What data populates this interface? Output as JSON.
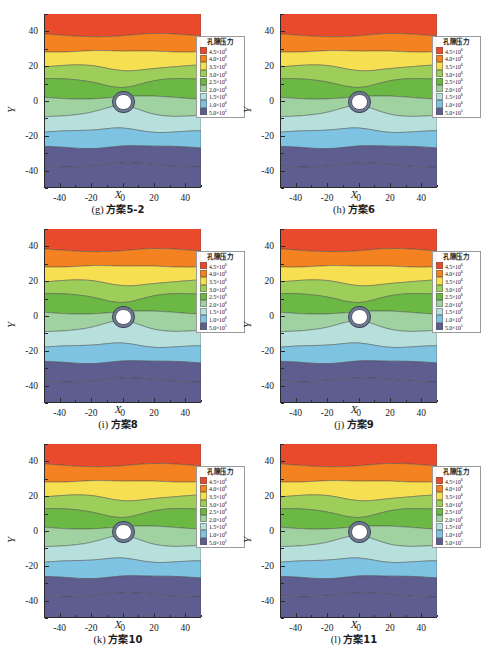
{
  "figure": {
    "axis_x_label": "X",
    "axis_y_label": "Y",
    "bottom_note": "",
    "legend_title": "孔隙压力"
  },
  "legend": {
    "title": "孔隙压力",
    "entries": [
      {
        "label": "4.5×10",
        "exp": "6",
        "color": "#ea4a2c"
      },
      {
        "label": "4.0×10",
        "exp": "6",
        "color": "#f58220"
      },
      {
        "label": "3.5×10",
        "exp": "6",
        "color": "#f7df52"
      },
      {
        "label": "3.0×10",
        "exp": "6",
        "color": "#9ece5a"
      },
      {
        "label": "2.5×10",
        "exp": "6",
        "color": "#6cb844"
      },
      {
        "label": "2.0×10",
        "exp": "6",
        "color": "#9fd2a0"
      },
      {
        "label": "1.5×10",
        "exp": "6",
        "color": "#b7dfdc"
      },
      {
        "label": "1.0×10",
        "exp": "6",
        "color": "#7fc3e2"
      },
      {
        "label": "5.0×10",
        "exp": "5",
        "color": "#5d5d90"
      }
    ]
  },
  "axes": {
    "x_ticks": [
      "-40",
      "-20",
      "0",
      "20",
      "40"
    ],
    "x_tick_values": [
      -40,
      -20,
      0,
      20,
      40
    ],
    "y_ticks": [
      "40",
      "20",
      "0",
      "-20",
      "-40"
    ],
    "y_tick_values": [
      40,
      20,
      0,
      -20,
      -40
    ],
    "xlim": [
      -50,
      50
    ],
    "ylim": [
      -50,
      50
    ]
  },
  "panels": [
    {
      "id": "panel-g",
      "tag": "(g)",
      "name": "方案5-2"
    },
    {
      "id": "panel-h",
      "tag": "(h)",
      "name": "方案6"
    },
    {
      "id": "panel-i",
      "tag": "(i)",
      "name": "方案8"
    },
    {
      "id": "panel-j",
      "tag": "(j)",
      "name": "方案9"
    },
    {
      "id": "panel-k",
      "tag": "(k)",
      "name": "方案10"
    },
    {
      "id": "panel-l",
      "tag": "(l)",
      "name": "方案11"
    }
  ],
  "chart_data": {
    "type": "heatmap",
    "title": "",
    "xlabel": "X",
    "ylabel": "Y",
    "xlim": [
      -50,
      50
    ],
    "ylim": [
      -50,
      50
    ],
    "grid": false,
    "legend_position": "inside-right",
    "colorbar_title": "孔隙压力",
    "colorbar_unit": "Pa",
    "contour_levels": [
      500000,
      1000000,
      1500000,
      2000000,
      2500000,
      3000000,
      3500000,
      4000000,
      4500000
    ],
    "contour_level_labels": [
      "5.0×10^5",
      "1.0×10^6",
      "1.5×10^6",
      "2.0×10^6",
      "2.5×10^6",
      "3.0×10^6",
      "3.5×10^6",
      "4.0×10^6",
      "4.5×10^6"
    ],
    "colors": [
      "#5d5d90",
      "#7fc3e2",
      "#b7dfdc",
      "#9fd2a0",
      "#6cb844",
      "#9ece5a",
      "#f7df52",
      "#f58220",
      "#ea4a2c"
    ],
    "tunnel": {
      "center_x": 0,
      "center_y": 0,
      "outer_radius": 6.5,
      "inner_radius": 4.5
    },
    "band_boundaries_y": [
      38,
      29,
      20,
      12,
      2,
      -8,
      -18,
      -27,
      -37
    ],
    "series": [
      {
        "name": "(g) 方案5-2",
        "values": [
          4500000,
          4000000,
          3500000,
          3000000,
          2500000,
          2000000,
          1500000,
          1000000,
          500000
        ]
      },
      {
        "name": "(h) 方案6",
        "values": [
          4500000,
          4000000,
          3500000,
          3000000,
          2500000,
          2000000,
          1500000,
          1000000,
          500000
        ]
      },
      {
        "name": "(i) 方案8",
        "values": [
          4500000,
          4000000,
          3500000,
          3000000,
          2500000,
          2000000,
          1500000,
          1000000,
          500000
        ]
      },
      {
        "name": "(j) 方案9",
        "values": [
          4500000,
          4000000,
          3500000,
          3000000,
          2500000,
          2000000,
          1500000,
          1000000,
          500000
        ]
      },
      {
        "name": "(k) 方案10",
        "values": [
          4500000,
          4000000,
          3500000,
          3000000,
          2500000,
          2000000,
          1500000,
          1000000,
          500000
        ]
      },
      {
        "name": "(l) 方案11",
        "values": [
          4500000,
          4000000,
          3500000,
          3000000,
          2500000,
          2000000,
          1500000,
          1000000,
          500000
        ]
      }
    ]
  }
}
